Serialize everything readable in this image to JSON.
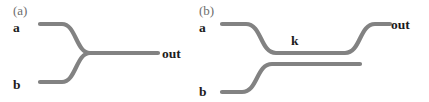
{
  "figure": {
    "background_color": "#ffffff",
    "waveguide_color": "#828282",
    "label_color": "#1c1c1c",
    "caption_color": "#6d6d6d",
    "width": 429,
    "height": 102
  },
  "panels": [
    {
      "id": "a",
      "caption": "(a)",
      "type": "y-junction-combiner",
      "ports": {
        "input_top": "a",
        "input_bottom": "b",
        "output": "out"
      },
      "waveguides": [
        {
          "name": "top-input-arm",
          "path": "M 40 24 L 62 24 C 76 24 76 53 90 53 L 158 53"
        },
        {
          "name": "bottom-input-arm",
          "path": "M 40 82 L 62 82 C 76 82 76 53 90 53"
        }
      ]
    },
    {
      "id": "b",
      "caption": "(b)",
      "type": "directional-coupler",
      "coupling_label": "k",
      "ports": {
        "input_top": "a",
        "input_bottom": "b",
        "output": "out"
      },
      "waveguides": [
        {
          "name": "upper-waveguide",
          "path": "M 222 24 L 246 24 C 262 24 260 53 276 53 L 345 53 C 361 53 359 24 375 24 L 390 24"
        },
        {
          "name": "lower-waveguide",
          "path": "M 222 92 L 242 92 C 258 92 256 64 272 64 L 360 64"
        }
      ]
    }
  ],
  "chart_data": {
    "type": "diagram",
    "panels": [
      "(a)",
      "(b)"
    ],
    "annotations": [
      "a",
      "b",
      "out",
      "k"
    ]
  }
}
